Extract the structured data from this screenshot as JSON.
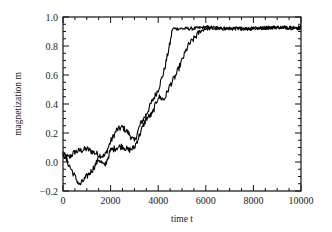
{
  "chart_data": {
    "type": "line",
    "title": "",
    "xlabel": "time t",
    "ylabel": "magnetization m",
    "xlim": [
      0,
      10000
    ],
    "ylim": [
      -0.2,
      1.0
    ],
    "grid": false,
    "legend": null,
    "x_ticks": [
      0,
      2000,
      4000,
      6000,
      8000,
      10000
    ],
    "x_tick_labels": [
      "0",
      "2000",
      "4000",
      "6000",
      "8000",
      "10000"
    ],
    "x_minor_step": 500,
    "y_ticks": [
      -0.2,
      0.0,
      0.2,
      0.4,
      0.6,
      0.8,
      1.0
    ],
    "y_tick_labels": [
      "−0.2",
      "0.0",
      "0.2",
      "0.4",
      "0.6",
      "0.8",
      "1.0"
    ],
    "y_minor_step": 0.05,
    "series": [
      {
        "name": "run 1",
        "x": [
          0,
          250,
          500,
          750,
          1000,
          1250,
          1500,
          1750,
          2000,
          2250,
          2500,
          2750,
          3000,
          3250,
          3500,
          3750,
          4000,
          4250,
          4500,
          4600,
          4750,
          5000,
          5500,
          6000,
          7000,
          8000,
          9000,
          10000
        ],
        "values": [
          0.05,
          0.03,
          0.07,
          0.08,
          0.09,
          0.07,
          0.05,
          0.04,
          0.14,
          0.22,
          0.24,
          0.2,
          0.14,
          0.26,
          0.33,
          0.42,
          0.5,
          0.63,
          0.82,
          0.92,
          0.92,
          0.92,
          0.92,
          0.93,
          0.92,
          0.92,
          0.93,
          0.93
        ]
      },
      {
        "name": "run 2",
        "x": [
          0,
          250,
          500,
          700,
          900,
          1250,
          1500,
          1750,
          2000,
          2250,
          2500,
          2750,
          3000,
          3250,
          3500,
          3750,
          4000,
          4250,
          4500,
          4750,
          5000,
          5250,
          5500,
          5750,
          6000,
          7000,
          8000,
          9000,
          10000
        ],
        "values": [
          0.06,
          -0.02,
          -0.1,
          -0.16,
          -0.12,
          -0.05,
          0.02,
          -0.03,
          0.08,
          0.1,
          0.11,
          0.08,
          0.1,
          0.2,
          0.3,
          0.33,
          0.45,
          0.43,
          0.53,
          0.6,
          0.7,
          0.8,
          0.85,
          0.9,
          0.92,
          0.92,
          0.92,
          0.93,
          0.92
        ]
      }
    ]
  }
}
